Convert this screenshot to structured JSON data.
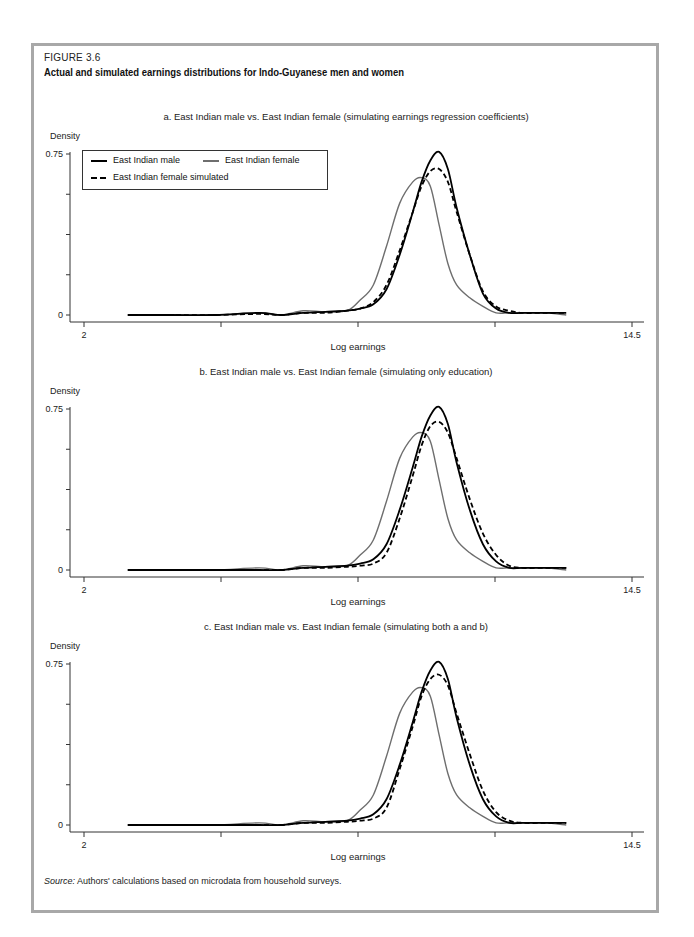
{
  "figure": {
    "label": "FIGURE 3.6",
    "title": "Actual and simulated earnings distributions for Indo-Guyanese men and women",
    "source_label": "Source:",
    "source_text": "Authors' calculations based on microdata from household surveys."
  },
  "legend": {
    "male": "East Indian male",
    "female": "East Indian female",
    "simulated": "East Indian female simulated"
  },
  "axis": {
    "ylabel": "Density",
    "xlabel": "Log earnings",
    "ytick_top": "0.75",
    "ytick_bottom": "0",
    "xtick_left": "2",
    "xtick_right": "14.5"
  },
  "panels": [
    {
      "title": "a. East Indian male vs. East Indian female (simulating earnings regression coefficients)"
    },
    {
      "title": "b. East Indian male vs. East Indian female (simulating only education)"
    },
    {
      "title": "c. East Indian male vs. East Indian female (simulating both a and b)"
    }
  ],
  "colors": {
    "male": "#000000",
    "female": "#6e6e6e",
    "simulated": "#000000",
    "frame": "#a8a8a8"
  },
  "chart_data": [
    {
      "type": "line",
      "title": "a. East Indian male vs. East Indian female (simulating earnings regression coefficients)",
      "xlabel": "Log earnings",
      "ylabel": "Density",
      "xlim": [
        2,
        14.5
      ],
      "ylim": [
        0,
        0.75
      ],
      "xticks_labeled": [
        2,
        14.5
      ],
      "yticks_labeled": [
        0,
        0.75
      ],
      "legend_position": "upper left",
      "grid": false,
      "x": [
        3.0,
        4.0,
        5.0,
        6.0,
        6.5,
        7.0,
        7.5,
        8.0,
        8.3,
        8.6,
        8.9,
        9.2,
        9.5,
        9.7,
        9.9,
        10.1,
        10.3,
        10.5,
        10.8,
        11.1,
        11.4,
        11.7,
        12.0,
        12.5,
        13.0
      ],
      "series": [
        {
          "name": "East Indian male",
          "style": "solid black",
          "values": [
            0.0,
            0.0,
            0.0,
            0.01,
            0.0,
            0.01,
            0.015,
            0.02,
            0.03,
            0.05,
            0.12,
            0.28,
            0.48,
            0.62,
            0.72,
            0.76,
            0.68,
            0.5,
            0.28,
            0.1,
            0.03,
            0.01,
            0.01,
            0.01,
            0.01
          ]
        },
        {
          "name": "East Indian female",
          "style": "solid gray",
          "values": [
            0.0,
            0.0,
            0.0,
            0.01,
            0.0,
            0.02,
            0.015,
            0.02,
            0.07,
            0.14,
            0.32,
            0.52,
            0.62,
            0.64,
            0.6,
            0.42,
            0.24,
            0.14,
            0.08,
            0.04,
            0.01,
            0.01,
            0.01,
            0.01,
            0.0
          ]
        },
        {
          "name": "East Indian female simulated",
          "style": "dashed black",
          "values": [
            0.0,
            0.0,
            0.0,
            0.005,
            0.0,
            0.01,
            0.01,
            0.02,
            0.03,
            0.06,
            0.14,
            0.3,
            0.48,
            0.6,
            0.67,
            0.68,
            0.62,
            0.48,
            0.28,
            0.11,
            0.04,
            0.02,
            0.01,
            0.01,
            0.01
          ]
        }
      ]
    },
    {
      "type": "line",
      "title": "b. East Indian male vs. East Indian female (simulating only education)",
      "xlabel": "Log earnings",
      "ylabel": "Density",
      "xlim": [
        2,
        14.5
      ],
      "ylim": [
        0,
        0.75
      ],
      "xticks_labeled": [
        2,
        14.5
      ],
      "yticks_labeled": [
        0,
        0.75
      ],
      "grid": false,
      "x": [
        3.0,
        4.0,
        5.0,
        6.0,
        6.5,
        7.0,
        7.5,
        8.0,
        8.3,
        8.6,
        8.9,
        9.2,
        9.5,
        9.7,
        9.9,
        10.1,
        10.3,
        10.5,
        10.8,
        11.1,
        11.4,
        11.7,
        12.0,
        12.5,
        13.0
      ],
      "series": [
        {
          "name": "East Indian male",
          "style": "solid black",
          "values": [
            0.0,
            0.0,
            0.0,
            0.0,
            0.0,
            0.01,
            0.015,
            0.02,
            0.03,
            0.05,
            0.12,
            0.28,
            0.48,
            0.62,
            0.72,
            0.76,
            0.68,
            0.5,
            0.28,
            0.12,
            0.04,
            0.01,
            0.01,
            0.01,
            0.01
          ]
        },
        {
          "name": "East Indian female",
          "style": "solid gray",
          "values": [
            0.0,
            0.0,
            0.0,
            0.01,
            0.0,
            0.02,
            0.015,
            0.02,
            0.07,
            0.14,
            0.32,
            0.52,
            0.62,
            0.64,
            0.6,
            0.42,
            0.24,
            0.14,
            0.08,
            0.04,
            0.01,
            0.01,
            0.01,
            0.01,
            0.0
          ]
        },
        {
          "name": "East Indian female simulated",
          "style": "dashed black",
          "values": [
            0.0,
            0.0,
            0.0,
            0.0,
            0.0,
            0.01,
            0.01,
            0.015,
            0.02,
            0.03,
            0.08,
            0.24,
            0.44,
            0.58,
            0.67,
            0.69,
            0.64,
            0.52,
            0.33,
            0.17,
            0.07,
            0.02,
            0.01,
            0.01,
            0.01
          ]
        }
      ]
    },
    {
      "type": "line",
      "title": "c. East Indian male vs. East Indian female (simulating both a and b)",
      "xlabel": "Log earnings",
      "ylabel": "Density",
      "xlim": [
        2,
        14.5
      ],
      "ylim": [
        0,
        0.75
      ],
      "xticks_labeled": [
        2,
        14.5
      ],
      "yticks_labeled": [
        0,
        0.75
      ],
      "grid": false,
      "x": [
        3.0,
        4.0,
        5.0,
        6.0,
        6.5,
        7.0,
        7.5,
        8.0,
        8.3,
        8.6,
        8.9,
        9.2,
        9.5,
        9.7,
        9.9,
        10.1,
        10.3,
        10.5,
        10.8,
        11.1,
        11.4,
        11.7,
        12.0,
        12.5,
        13.0
      ],
      "series": [
        {
          "name": "East Indian male",
          "style": "solid black",
          "values": [
            0.0,
            0.0,
            0.0,
            0.0,
            0.0,
            0.01,
            0.015,
            0.02,
            0.03,
            0.05,
            0.12,
            0.28,
            0.48,
            0.62,
            0.72,
            0.76,
            0.68,
            0.5,
            0.28,
            0.12,
            0.04,
            0.01,
            0.01,
            0.01,
            0.01
          ]
        },
        {
          "name": "East Indian female",
          "style": "solid gray",
          "values": [
            0.0,
            0.0,
            0.0,
            0.01,
            0.0,
            0.02,
            0.015,
            0.02,
            0.07,
            0.14,
            0.32,
            0.52,
            0.62,
            0.64,
            0.6,
            0.42,
            0.24,
            0.14,
            0.08,
            0.04,
            0.01,
            0.01,
            0.01,
            0.01,
            0.0
          ]
        },
        {
          "name": "East Indian female simulated",
          "style": "dashed black",
          "values": [
            0.0,
            0.0,
            0.0,
            0.0,
            0.0,
            0.01,
            0.01,
            0.015,
            0.02,
            0.03,
            0.08,
            0.26,
            0.46,
            0.6,
            0.68,
            0.7,
            0.65,
            0.52,
            0.33,
            0.16,
            0.06,
            0.02,
            0.01,
            0.01,
            0.01
          ]
        }
      ]
    }
  ]
}
